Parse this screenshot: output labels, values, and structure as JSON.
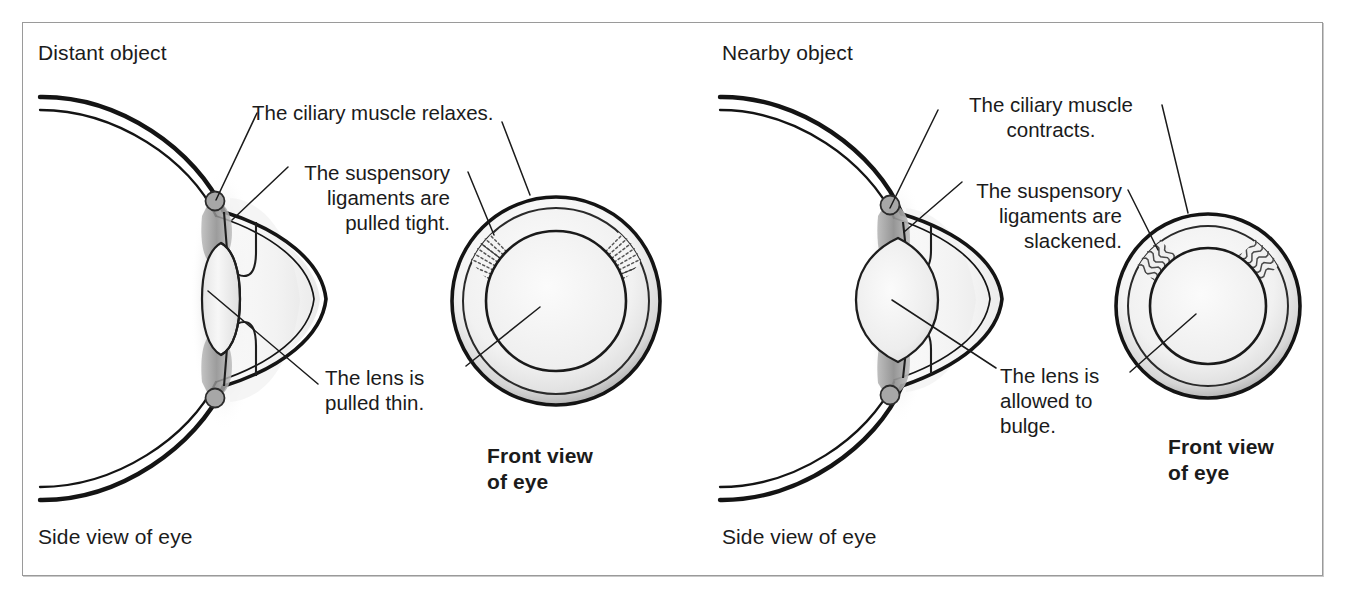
{
  "figure": {
    "title_distant": "Distant object",
    "title_nearby": "Nearby object",
    "border_color": "#9a9a9a",
    "ink_color": "#1b1b1b",
    "background": "#ffffff"
  },
  "panels": [
    {
      "id": "distant",
      "heading": "Distant object",
      "side_view_caption": "Side view of eye",
      "front_view_caption": "Front view\nof eye",
      "callouts": [
        {
          "id": "ciliary",
          "text": "The ciliary muscle relaxes."
        },
        {
          "id": "ligaments",
          "text": "The suspensory\nligaments are\npulled tight."
        },
        {
          "id": "lens",
          "text": "The lens is\npulled thin."
        }
      ],
      "front_view": {
        "ligament_style": "straight-dotted",
        "lens_size": "large"
      },
      "side_view": {
        "lens_shape": "thin"
      }
    },
    {
      "id": "nearby",
      "heading": "Nearby object",
      "side_view_caption": "Side view of eye",
      "front_view_caption": "Front view\nof eye",
      "callouts": [
        {
          "id": "ciliary",
          "text": "The ciliary muscle\ncontracts."
        },
        {
          "id": "ligaments",
          "text": "The suspensory\nligaments are\nslackened."
        },
        {
          "id": "lens",
          "text": "The lens is\nallowed to\nbulge."
        }
      ],
      "front_view": {
        "ligament_style": "wavy",
        "lens_size": "small"
      },
      "side_view": {
        "lens_shape": "bulging"
      }
    }
  ]
}
